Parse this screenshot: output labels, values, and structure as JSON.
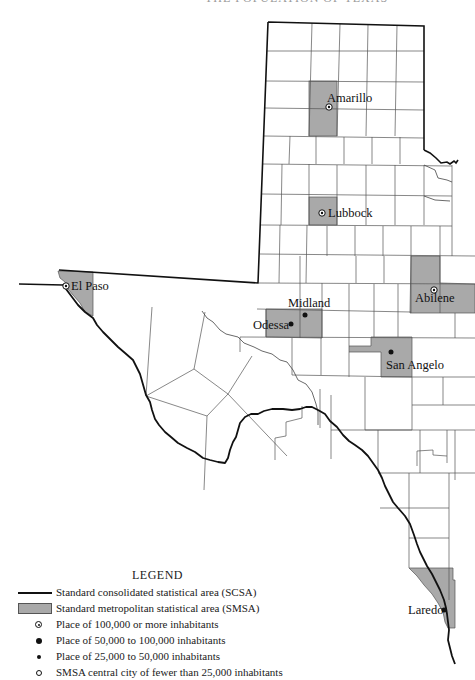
{
  "header": {
    "page_number": "",
    "title": "THE POPULATION OF TEXAS"
  },
  "map": {
    "cities": [
      {
        "name": "Amarillo",
        "class": "100000+",
        "symbol": "ring-dot"
      },
      {
        "name": "Lubbock",
        "class": "100000+",
        "symbol": "ring-dot"
      },
      {
        "name": "Abilene",
        "class": "100000+",
        "symbol": "ring-dot"
      },
      {
        "name": "El Paso",
        "class": "100000+",
        "symbol": "ring-dot"
      },
      {
        "name": "Midland",
        "class": "50000-100000",
        "symbol": "dot"
      },
      {
        "name": "Odessa",
        "class": "50000-100000",
        "symbol": "dot"
      },
      {
        "name": "San Angelo",
        "class": "50000-100000",
        "symbol": "dot"
      },
      {
        "name": "Laredo",
        "class": "50000-100000",
        "symbol": "dot"
      }
    ],
    "colors": {
      "smsa_fill": "#a9a9a9",
      "boundary": "#111111",
      "county_line": "#555555",
      "background": "#ffffff"
    }
  },
  "legend": {
    "title": "LEGEND",
    "items": [
      {
        "symbol": "thick-line",
        "label": "Standard consolidated statistical area (SCSA)"
      },
      {
        "symbol": "gray-box",
        "label": "Standard metropolitan statistical area (SMSA)"
      },
      {
        "symbol": "ring-dot",
        "label": "Place of 100,000 or more inhabitants"
      },
      {
        "symbol": "large-dot",
        "label": "Place of 50,000 to 100,000 inhabitants"
      },
      {
        "symbol": "small-dot",
        "label": "Place of 25,000 to 50,000 inhabitants"
      },
      {
        "symbol": "open-circle",
        "label": "SMSA central city of fewer than 25,000 inhabitants"
      }
    ]
  }
}
